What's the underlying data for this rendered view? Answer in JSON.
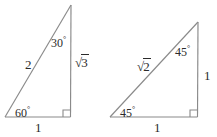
{
  "figure": {
    "background_color": "#ffffff",
    "line_color": "#8a8a8a",
    "text_color": "#2b2b2b"
  },
  "triangles": [
    {
      "name": "30-60-90-triangle",
      "type": "30-60-90",
      "vertices": {
        "bottom_left": [
          5,
          117
        ],
        "bottom_right": [
          70,
          117
        ],
        "apex": [
          71,
          5
        ]
      },
      "right_angle_at": "bottom_right",
      "angles": {
        "bottom_left": "60",
        "apex": "30",
        "bottom_right": "90"
      },
      "labels": {
        "angle_bottom_left": "60",
        "angle_apex": "30",
        "side_hypotenuse": "2",
        "side_vertical_radicand": "3",
        "side_base": "1",
        "degree_symbol": "°",
        "radical_symbol": "√"
      }
    },
    {
      "name": "45-45-90-triangle",
      "type": "45-45-90",
      "vertices": {
        "bottom_left": [
          110,
          117
        ],
        "bottom_right": [
          197,
          117
        ],
        "apex": [
          198,
          22
        ]
      },
      "right_angle_at": "bottom_right",
      "angles": {
        "bottom_left": "45",
        "apex": "45",
        "bottom_right": "90"
      },
      "labels": {
        "angle_bottom_left": "45",
        "angle_apex": "45",
        "side_hypotenuse_radicand": "2",
        "side_vertical": "1",
        "side_base": "1",
        "degree_symbol": "°",
        "radical_symbol": "√"
      }
    }
  ]
}
